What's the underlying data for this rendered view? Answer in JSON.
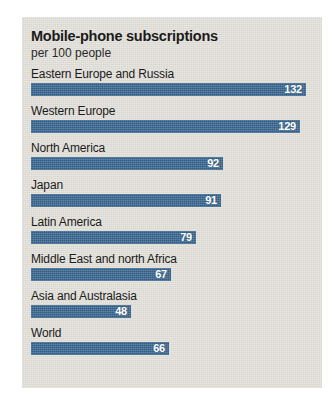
{
  "chart_data": {
    "type": "bar",
    "title": "Mobile-phone subscriptions",
    "subtitle": "per 100 people",
    "xlabel": "",
    "ylabel": "",
    "orientation": "horizontal",
    "grid": false,
    "legend": false,
    "xlim": [
      0,
      132
    ],
    "value_unit": "subscriptions per 100 people",
    "bar_color": "#3c6a94",
    "background_color": "#dedbd4",
    "categories": [
      "Eastern Europe and Russia",
      "Western Europe",
      "North America",
      "Japan",
      "Latin America",
      "Middle East and north Africa",
      "Asia and Australasia",
      "World"
    ],
    "values": [
      132,
      129,
      92,
      91,
      79,
      67,
      48,
      66
    ],
    "rows": [
      {
        "label": "Eastern Europe and Russia",
        "value": 132,
        "value_text": "132"
      },
      {
        "label": "Western Europe",
        "value": 129,
        "value_text": "129"
      },
      {
        "label": "North America",
        "value": 92,
        "value_text": "92"
      },
      {
        "label": "Japan",
        "value": 91,
        "value_text": "91"
      },
      {
        "label": "Latin America",
        "value": 79,
        "value_text": "79"
      },
      {
        "label": "Middle East and north Africa",
        "value": 67,
        "value_text": "67"
      },
      {
        "label": "Asia and Australasia",
        "value": 48,
        "value_text": "48"
      },
      {
        "label": "World",
        "value": 66,
        "value_text": "66"
      }
    ]
  }
}
